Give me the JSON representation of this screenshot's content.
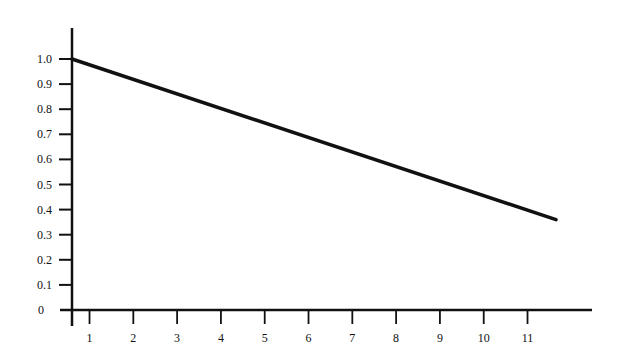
{
  "chart_data": {
    "type": "line",
    "title": "",
    "xlabel": "",
    "ylabel": "",
    "x_ticks": [
      "1",
      "2",
      "3",
      "4",
      "5",
      "6",
      "7",
      "8",
      "9",
      "10",
      "11"
    ],
    "y_ticks": [
      "0",
      "0.1",
      "0.2",
      "0.3",
      "0.4",
      "0.5",
      "0.6",
      "0.7",
      "0.8",
      "0.9",
      "1.0"
    ],
    "xlim": [
      0.6,
      12.4
    ],
    "ylim": [
      0,
      1.1
    ],
    "grid": false,
    "legend": null,
    "series": [
      {
        "name": "line",
        "color": "#111111",
        "x": [
          0.6,
          11.65
        ],
        "y": [
          1.0,
          0.36
        ]
      }
    ]
  }
}
